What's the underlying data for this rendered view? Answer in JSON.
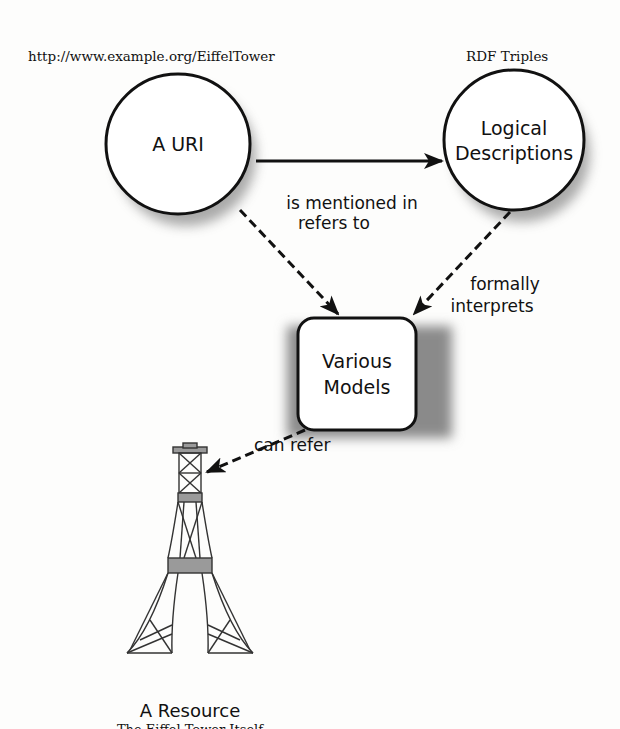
{
  "labels": {
    "uri_example": "http://www.example.org/EiffelTower",
    "rdf_triples": "RDF Triples"
  },
  "nodes": {
    "uri": {
      "label": "A URI"
    },
    "logical": {
      "line1": "Logical",
      "line2": "Descriptions"
    },
    "models": {
      "line1": "Various",
      "line2": "Models"
    },
    "resource": {
      "title": "A Resource",
      "subtitle": "The Eiffel Tower Itself",
      "icon": "eiffel-tower-icon"
    }
  },
  "edges": {
    "mentioned": {
      "label": "is mentioned in",
      "style": "solid"
    },
    "refers": {
      "label": "refers to",
      "style": "dashed"
    },
    "interprets": {
      "line1": "formally",
      "line2": "interprets",
      "style": "dashed"
    },
    "can_refer": {
      "label": "can refer",
      "style": "dashed"
    }
  },
  "colors": {
    "stroke": "#111111",
    "shadow": "#8a8a8a",
    "tower_band": "#9a9a9a",
    "background": "#fdfdfc"
  }
}
